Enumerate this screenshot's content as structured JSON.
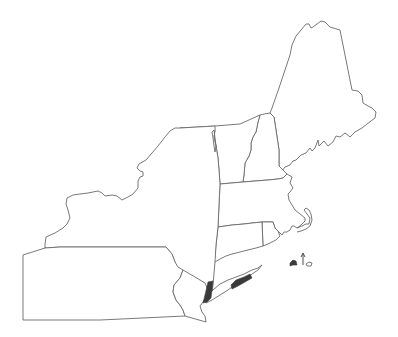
{
  "map": {
    "title": "",
    "region": "Northeastern United States",
    "states": [
      {
        "name": "Maine",
        "shaded": false
      },
      {
        "name": "New Hampshire",
        "shaded": false
      },
      {
        "name": "Vermont",
        "shaded": false
      },
      {
        "name": "Massachusetts",
        "shaded": false
      },
      {
        "name": "Rhode Island",
        "shaded": false
      },
      {
        "name": "Connecticut",
        "shaded": false
      },
      {
        "name": "New York",
        "shaded": false
      },
      {
        "name": "Pennsylvania",
        "shaded": false
      },
      {
        "name": "New Jersey",
        "shaded": false
      }
    ],
    "highlighted_areas": [
      {
        "name": "New York City area",
        "color": "#3a3a3a"
      },
      {
        "name": "Central Long Island",
        "color": "#3a3a3a"
      },
      {
        "name": "Martha's Vineyard",
        "color": "#3a3a3a"
      },
      {
        "name": "Nantucket (arrow marker)",
        "color": "#3a3a3a"
      }
    ],
    "colors": {
      "outline": "#6a6a6a",
      "fill": "#ffffff",
      "highlight": "#3a3a3a"
    }
  }
}
